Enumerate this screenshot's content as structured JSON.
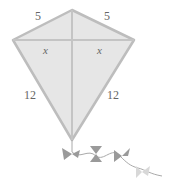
{
  "diagram": {
    "type": "kite",
    "labels": {
      "top_left_side": "5",
      "top_right_side": "5",
      "left_half_crossbar": "x",
      "right_half_crossbar": "x",
      "bottom_left_side": "12",
      "bottom_right_side": "12"
    },
    "colors": {
      "fill": "#e6e6e6",
      "stroke": "#bdbdbd",
      "text": "#666666",
      "bow": "#9a9a9a"
    }
  }
}
